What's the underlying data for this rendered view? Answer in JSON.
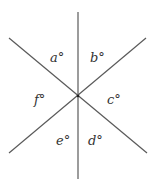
{
  "diagram": {
    "line_color": "#5a5a5a",
    "lines": [
      {
        "name": "vertical-line",
        "x1": 78,
        "y1": 12,
        "x2": 78,
        "y2": 179
      },
      {
        "name": "descending-diagonal-line",
        "x1": 9,
        "y1": 38,
        "x2": 147,
        "y2": 153
      },
      {
        "name": "ascending-diagonal-line",
        "x1": 146,
        "y1": 38,
        "x2": 9,
        "y2": 153
      }
    ],
    "intersection": {
      "x": 78,
      "y": 96
    },
    "angles": [
      {
        "id": "a",
        "text": "a°",
        "x": 50,
        "y": 51
      },
      {
        "id": "b",
        "text": "b°",
        "x": 90,
        "y": 51
      },
      {
        "id": "c",
        "text": "c°",
        "x": 107,
        "y": 93
      },
      {
        "id": "d",
        "text": "d°",
        "x": 88,
        "y": 134
      },
      {
        "id": "e",
        "text": "e°",
        "x": 56,
        "y": 134
      },
      {
        "id": "f",
        "text": "f°",
        "x": 34,
        "y": 93
      }
    ]
  }
}
